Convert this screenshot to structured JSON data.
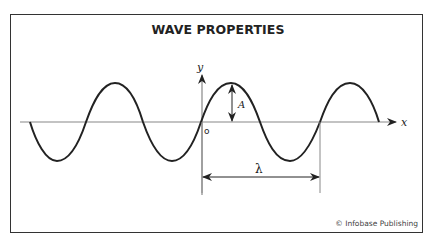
{
  "title": "WAVE PROPERTIES",
  "credit": "© Infobase Publishing",
  "labels": {
    "y_axis": "y",
    "x_axis": "x",
    "origin": "o",
    "amplitude": "A",
    "wavelength": "λ"
  },
  "colors": {
    "wave": "#222222",
    "axis": "#888888",
    "border": "#333333"
  }
}
